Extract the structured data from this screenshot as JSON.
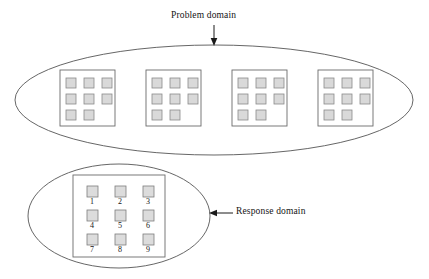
{
  "figure": {
    "width": 429,
    "height": 279,
    "background_color": "#ffffff"
  },
  "labels": {
    "problem_domain": "Problem domain",
    "response_domain": "Response domain"
  },
  "colors": {
    "ellipse_stroke": "#555555",
    "block_frame_stroke": "#6b6b6b",
    "cell_fill": "#d9d9d9",
    "cell_stroke": "#8a8a8a",
    "text": "#141414",
    "arrow": "#1a1a1a"
  },
  "problem_domain": {
    "label": "Problem domain",
    "arrow_direction": "down",
    "ellipse": {
      "cx": 214,
      "cy": 100,
      "rx": 199,
      "ry": 55
    },
    "matrices": [
      {
        "name": "matrix-1",
        "frame": {
          "x": 60,
          "y": 70,
          "width": 55,
          "height": 56
        },
        "rows": 3,
        "cols": 3,
        "filled_cells": [
          1,
          1,
          1,
          1,
          1,
          1,
          1,
          1,
          0
        ],
        "filled_count": 8
      },
      {
        "name": "matrix-2",
        "frame": {
          "x": 146,
          "y": 70,
          "width": 55,
          "height": 56
        },
        "rows": 3,
        "cols": 3,
        "filled_cells": [
          1,
          1,
          1,
          1,
          1,
          1,
          1,
          1,
          0
        ],
        "filled_count": 8
      },
      {
        "name": "matrix-3",
        "frame": {
          "x": 232,
          "y": 70,
          "width": 55,
          "height": 56
        },
        "rows": 3,
        "cols": 3,
        "filled_cells": [
          1,
          1,
          1,
          1,
          1,
          1,
          1,
          1,
          0
        ],
        "filled_count": 8
      },
      {
        "name": "matrix-4",
        "frame": {
          "x": 318,
          "y": 70,
          "width": 55,
          "height": 56
        },
        "rows": 3,
        "cols": 3,
        "filled_cells": [
          1,
          1,
          1,
          1,
          1,
          1,
          1,
          1,
          0
        ],
        "filled_count": 8
      }
    ]
  },
  "response_domain": {
    "label": "Response domain",
    "arrow_direction": "left",
    "ellipse": {
      "cx": 119,
      "cy": 216,
      "rx": 91,
      "ry": 52
    },
    "frame": {
      "x": 73,
      "y": 175,
      "width": 92,
      "height": 82
    },
    "rows": 3,
    "cols": 3,
    "options": [
      {
        "number": "1",
        "row": 0,
        "col": 0
      },
      {
        "number": "2",
        "row": 0,
        "col": 1
      },
      {
        "number": "3",
        "row": 0,
        "col": 2
      },
      {
        "number": "4",
        "row": 1,
        "col": 0
      },
      {
        "number": "5",
        "row": 1,
        "col": 1
      },
      {
        "number": "6",
        "row": 1,
        "col": 2
      },
      {
        "number": "7",
        "row": 2,
        "col": 0
      },
      {
        "number": "8",
        "row": 2,
        "col": 1
      },
      {
        "number": "9",
        "row": 2,
        "col": 2
      }
    ]
  }
}
